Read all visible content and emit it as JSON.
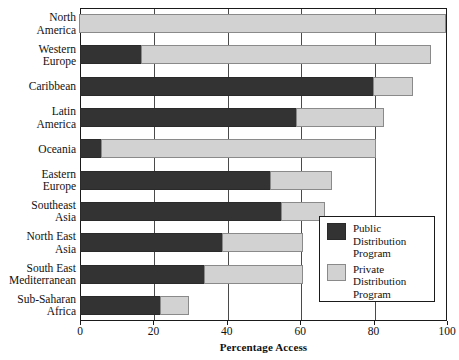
{
  "chart_data": {
    "type": "bar",
    "orientation": "horizontal",
    "stacked": true,
    "title": "",
    "xlabel": "Percentage Access",
    "ylabel": "",
    "xlim": [
      0,
      100
    ],
    "xticks": [
      0,
      20,
      40,
      60,
      80,
      100
    ],
    "grid": true,
    "grid_axis": "x",
    "legend_position": "lower right",
    "categories": [
      "North America",
      "Western Europe",
      "Caribbean",
      "Latin America",
      "Oceania",
      "Eastern Europe",
      "Southeast Asia",
      "North East Asia",
      "South East Mediterranean",
      "Sub-Saharan Africa"
    ],
    "series": [
      {
        "name": "Public Distribution Program",
        "color": "#333333",
        "values": [
          0,
          17,
          80,
          59,
          6,
          52,
          55,
          39,
          34,
          22
        ]
      },
      {
        "name": "Private Distribution Program",
        "color": "#d2d2d2",
        "values": [
          100,
          79,
          11,
          24,
          75,
          17,
          12,
          22,
          27,
          8
        ]
      }
    ],
    "totals": [
      100,
      96,
      91,
      83,
      81,
      69,
      67,
      61,
      61,
      30
    ]
  },
  "axis": {
    "x_title": "Percentage Access",
    "tick_labels": [
      "0",
      "20",
      "40",
      "60",
      "80",
      "100"
    ]
  },
  "category_labels": [
    {
      "lines": [
        "North",
        "America"
      ]
    },
    {
      "lines": [
        "Western",
        "Europe"
      ]
    },
    {
      "lines": [
        "Caribbean"
      ]
    },
    {
      "lines": [
        "Latin",
        "America"
      ]
    },
    {
      "lines": [
        "Oceania"
      ]
    },
    {
      "lines": [
        "Eastern",
        "Europe"
      ]
    },
    {
      "lines": [
        "Southeast",
        "Asia"
      ]
    },
    {
      "lines": [
        "North East",
        "Asia"
      ]
    },
    {
      "lines": [
        "South East",
        "Mediterranean"
      ]
    },
    {
      "lines": [
        "Sub-Saharan",
        "Africa"
      ]
    }
  ],
  "legend": {
    "entries": [
      {
        "swatch": "public",
        "lines": [
          "Public",
          "Distribution",
          "Program"
        ]
      },
      {
        "swatch": "private",
        "lines": [
          "Private",
          "Distribution",
          "Program"
        ]
      }
    ]
  },
  "colors": {
    "public": "#333333",
    "private": "#d2d2d2",
    "frame": "#1a1a1a",
    "background": "#ffffff"
  }
}
